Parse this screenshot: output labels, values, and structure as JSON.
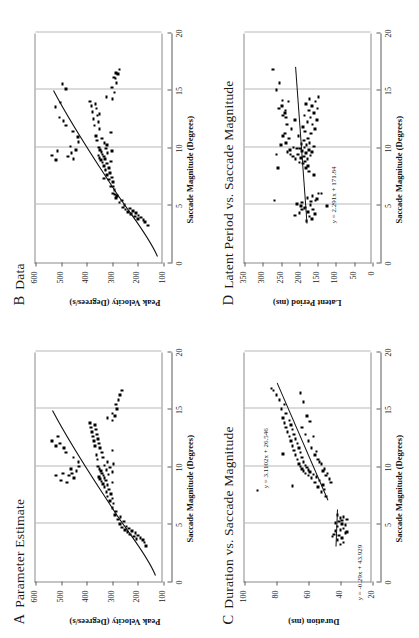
{
  "figure": {
    "orientation": "rotated-90-ccw",
    "background": "#ffffff",
    "ink": "#111111",
    "grid_color": "#b8b8b8"
  },
  "panels": [
    {
      "letter": "A",
      "title": "Parameter Estimate",
      "chart_data": {
        "type": "scatter",
        "title": "A Parameter Estimate",
        "xlabel": "Saccade Magnitude (Degrees)",
        "ylabel": "Peak Velocity (Degrees/s)",
        "xlim": [
          0,
          20
        ],
        "ylim": [
          100,
          600
        ],
        "xticks": [
          0,
          5,
          10,
          15,
          20
        ],
        "yticks": [
          100,
          200,
          300,
          400,
          500,
          600
        ],
        "grid": "vertical",
        "legend": "none",
        "fit": "monotonic saturating curve",
        "x": [
          3.1,
          3.4,
          3.6,
          3.7,
          3.8,
          3.9,
          4.0,
          4.1,
          4.2,
          4.3,
          4.4,
          4.5,
          4.6,
          4.7,
          4.8,
          5.0,
          5.2,
          5.4,
          5.6,
          5.8,
          6.1,
          6.4,
          6.8,
          7.0,
          7.2,
          7.4,
          7.6,
          7.8,
          8.0,
          8.2,
          8.4,
          8.5,
          8.6,
          8.7,
          8.8,
          8.9,
          9.0,
          9.1,
          9.2,
          9.3,
          9.4,
          9.5,
          9.6,
          9.7,
          9.8,
          9.9,
          10.0,
          10.1,
          10.2,
          10.4,
          10.6,
          10.8,
          11.0,
          11.2,
          11.4,
          11.6,
          11.8,
          12.0,
          12.2,
          12.4,
          12.6,
          12.8,
          13.0,
          13.2,
          13.4,
          13.6,
          13.8,
          14.0,
          14.2,
          14.4,
          14.6,
          15.0,
          15.4,
          15.8,
          16.2,
          16.6,
          9.0,
          9.2,
          9.4,
          9.6,
          9.8,
          10.0,
          10.4,
          10.8,
          11.2,
          11.6,
          12.0,
          11.8,
          12.2,
          12.6,
          9.2,
          8.8,
          8.6,
          9.4
        ],
        "y": [
          168,
          175,
          180,
          205,
          190,
          215,
          200,
          230,
          210,
          240,
          222,
          250,
          235,
          262,
          245,
          270,
          255,
          278,
          268,
          290,
          285,
          300,
          295,
          310,
          300,
          318,
          305,
          322,
          312,
          330,
          318,
          336,
          300,
          342,
          325,
          348,
          330,
          352,
          335,
          315,
          340,
          300,
          345,
          322,
          350,
          310,
          355,
          330,
          296,
          318,
          358,
          336,
          362,
          340,
          300,
          348,
          368,
          352,
          372,
          356,
          376,
          360,
          380,
          364,
          384,
          368,
          388,
          300,
          318,
          290,
          300,
          282,
          286,
          276,
          270,
          262,
          450,
          470,
          458,
          440,
          462,
          430,
          432,
          452,
          480,
          488,
          504,
          520,
          535,
          512,
          520,
          500,
          478,
          492
        ]
      }
    },
    {
      "letter": "B",
      "title": "Data",
      "chart_data": {
        "type": "scatter",
        "title": "B Data",
        "xlabel": "Saccade Magnitude (Degrees)",
        "ylabel": "Peak Velocity (Degrees/s)",
        "xlim": [
          0,
          20
        ],
        "ylim": [
          100,
          600
        ],
        "xticks": [
          0,
          5,
          10,
          15,
          20
        ],
        "yticks": [
          100,
          200,
          300,
          400,
          500,
          600
        ],
        "grid": "vertical",
        "legend": "none",
        "fit": "monotonic saturating curve",
        "x": [
          3.2,
          3.5,
          3.7,
          3.8,
          3.9,
          4.0,
          4.1,
          4.2,
          4.3,
          4.4,
          4.5,
          4.6,
          4.7,
          4.8,
          5.0,
          5.2,
          5.4,
          5.6,
          5.8,
          6.0,
          6.3,
          6.6,
          7.0,
          7.2,
          7.4,
          7.6,
          7.8,
          8.0,
          8.2,
          8.4,
          8.6,
          8.7,
          8.8,
          8.9,
          9.0,
          9.1,
          9.2,
          9.3,
          9.4,
          9.5,
          9.6,
          9.7,
          9.8,
          9.9,
          10.0,
          10.2,
          10.4,
          10.6,
          10.8,
          11.0,
          11.3,
          11.6,
          11.9,
          12.2,
          12.5,
          12.8,
          13.1,
          13.4,
          13.6,
          13.8,
          14.0,
          14.2,
          14.4,
          14.8,
          15.2,
          15.6,
          16.0,
          16.4,
          16.8,
          9.0,
          9.2,
          9.5,
          9.8,
          10.1,
          10.5,
          10.9,
          11.4,
          11.9,
          12.3,
          12.6,
          8.9,
          9.3,
          9.7,
          13.5,
          13.9,
          15.1,
          15.5,
          16.1,
          16.5,
          5.9,
          6.6,
          7.3,
          8.1,
          12.9
        ],
        "y": [
          160,
          172,
          178,
          200,
          188,
          212,
          198,
          228,
          208,
          238,
          220,
          248,
          232,
          258,
          252,
          272,
          262,
          286,
          282,
          298,
          292,
          306,
          298,
          312,
          302,
          320,
          308,
          326,
          314,
          332,
          320,
          338,
          304,
          344,
          328,
          350,
          332,
          354,
          338,
          318,
          342,
          302,
          348,
          324,
          352,
          320,
          330,
          360,
          340,
          364,
          306,
          350,
          370,
          354,
          374,
          358,
          378,
          362,
          382,
          366,
          386,
          300,
          322,
          292,
          302,
          284,
          288,
          278,
          272,
          452,
          472,
          460,
          442,
          464,
          432,
          434,
          454,
          482,
          490,
          506,
          520,
          536,
          514,
          522,
          502,
          480,
          494,
          294,
          286,
          290,
          296,
          332,
          326,
          350,
          292
        ]
      }
    },
    {
      "letter": "C",
      "title": "Duration vs. Saccade Magnitude",
      "chart_data": {
        "type": "scatter",
        "title": "C Duration vs. Saccade Magnitude",
        "xlabel": "Saccade Magnitude (Degrees)",
        "ylabel": "Duration (ms)",
        "xlim": [
          0,
          20
        ],
        "ylim": [
          20,
          100
        ],
        "xticks": [
          0,
          5,
          10,
          15,
          20
        ],
        "yticks": [
          20,
          40,
          60,
          80,
          100
        ],
        "grid": "vertical",
        "legend": "none",
        "annotations": [
          {
            "text": "y = 3.1102x + 26.546",
            "slope": 3.1102,
            "intercept": 26.546,
            "segment": "upper"
          },
          {
            "text": "y = -0.29x + 43.929",
            "slope": -0.29,
            "intercept": 43.929,
            "segment": "lower"
          }
        ],
        "x": [
          3.2,
          3.4,
          3.6,
          3.8,
          4.0,
          4.2,
          4.4,
          4.5,
          4.6,
          4.8,
          5.0,
          5.2,
          5.4,
          5.5,
          5.6,
          5.8,
          4.1,
          4.9,
          5.1,
          3.9,
          4.3,
          5.3,
          7.4,
          7.8,
          8.0,
          8.2,
          8.4,
          8.6,
          8.8,
          9.0,
          9.1,
          9.2,
          9.3,
          9.4,
          9.5,
          9.6,
          9.7,
          9.8,
          9.9,
          10.0,
          10.1,
          10.2,
          10.4,
          10.6,
          10.8,
          11.0,
          11.2,
          11.4,
          11.6,
          11.8,
          12.0,
          12.2,
          12.4,
          12.6,
          12.8,
          13.0,
          13.2,
          13.4,
          13.6,
          13.8,
          14.0,
          14.2,
          14.6,
          15.0,
          15.4,
          15.8,
          16.2,
          16.6,
          16.8,
          9.4,
          9.8,
          10.2,
          10.6,
          11.0,
          11.6,
          12.2,
          12.8,
          13.4,
          8.6,
          8.9,
          9.2,
          9.6,
          10.4,
          11.3,
          12.6,
          13.9,
          14.4,
          15.6,
          16.4,
          11.1,
          8.3,
          7.9
        ],
        "y": [
          40,
          38,
          42,
          39,
          41,
          37,
          43,
          40,
          38,
          42,
          39,
          41,
          36,
          40,
          38,
          42,
          44,
          37,
          43,
          45,
          36,
          39,
          49,
          52,
          50,
          54,
          51,
          56,
          53,
          58,
          55,
          60,
          57,
          62,
          59,
          63,
          60,
          64,
          61,
          65,
          62,
          66,
          63,
          67,
          64,
          68,
          65,
          69,
          66,
          70,
          67,
          71,
          68,
          72,
          69,
          73,
          70,
          74,
          71,
          75,
          72,
          76,
          74,
          77,
          75,
          78,
          80,
          82,
          83,
          48,
          50,
          52,
          54,
          56,
          58,
          60,
          62,
          64,
          46,
          47,
          49,
          51,
          53,
          55,
          57,
          59,
          61,
          63,
          65,
          76,
          70,
          92
        ]
      }
    },
    {
      "letter": "D",
      "title": "Latent Period vs. Saccade Magnitude",
      "chart_data": {
        "type": "scatter",
        "title": "D Latent Period vs. Saccade Magnitude",
        "xlabel": "Saccade Magnitude (Degrees)",
        "ylabel": "Latent Period (ms)",
        "xlim": [
          0,
          20
        ],
        "ylim": [
          0,
          350
        ],
        "xticks": [
          0,
          5,
          10,
          15,
          20
        ],
        "yticks": [
          0,
          50,
          100,
          150,
          200,
          250,
          300,
          350
        ],
        "grid": "vertical",
        "legend": "none",
        "annotations": [
          {
            "text": "y = 2.291x + 171.84",
            "slope": 2.291,
            "intercept": 171.84
          }
        ],
        "x": [
          3.6,
          3.8,
          4.0,
          4.2,
          4.4,
          4.6,
          4.8,
          5.0,
          5.2,
          5.4,
          5.6,
          5.8,
          6.0,
          4.3,
          4.7,
          5.1,
          5.5,
          4.1,
          4.9,
          5.3,
          7.6,
          7.9,
          8.2,
          8.4,
          8.6,
          8.8,
          9.0,
          9.1,
          9.2,
          9.3,
          9.4,
          9.5,
          9.6,
          9.7,
          9.8,
          9.9,
          10.0,
          10.1,
          10.2,
          10.3,
          10.4,
          10.6,
          10.8,
          11.0,
          11.2,
          11.4,
          11.6,
          11.8,
          12.0,
          12.2,
          12.4,
          12.6,
          12.8,
          13.0,
          13.2,
          13.4,
          13.6,
          13.8,
          14.0,
          14.2,
          14.4,
          9.0,
          9.2,
          9.4,
          9.6,
          9.8,
          10.0,
          10.4,
          10.8,
          11.2,
          11.6,
          12.0,
          12.4,
          12.8,
          13.2,
          13.6,
          14.0,
          5.4,
          4.6,
          8.2,
          9.4,
          10.2,
          11.0,
          13.4,
          14.1,
          15.0,
          15.6,
          16.8,
          12.6,
          13.0,
          8.7,
          9.9,
          4.9,
          6.0
        ],
        "y": [
          180,
          166,
          172,
          158,
          176,
          162,
          184,
          170,
          192,
          156,
          178,
          164,
          148,
          200,
          186,
          206,
          152,
          212,
          196,
          168,
          160,
          174,
          182,
          176,
          190,
          184,
          178,
          196,
          188,
          170,
          204,
          182,
          166,
          192,
          174,
          198,
          186,
          160,
          180,
          194,
          172,
          188,
          176,
          202,
          168,
          184,
          158,
          190,
          164,
          178,
          152,
          170,
          186,
          160,
          174,
          150,
          166,
          182,
          156,
          172,
          148,
          210,
          218,
          224,
          232,
          226,
          216,
          236,
          228,
          240,
          222,
          234,
          212,
          244,
          238,
          248,
          230,
          268,
          192,
          258,
          262,
          250,
          244,
          256,
          246,
          262,
          254,
          272,
          236,
          240,
          200,
          206,
          124,
          140
        ]
      }
    }
  ]
}
